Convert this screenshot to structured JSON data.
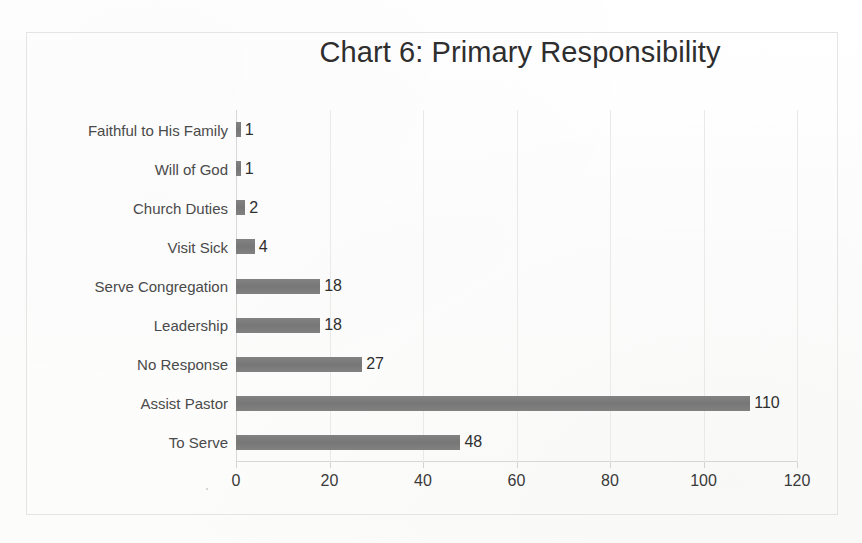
{
  "chart_data": {
    "type": "bar",
    "orientation": "horizontal",
    "title": "Chart 6: Primary Responsibility",
    "xlabel": "",
    "ylabel": "",
    "xlim": [
      0,
      120
    ],
    "xticks": [
      "0",
      "20",
      "40",
      "60",
      "80",
      "100",
      "120"
    ],
    "grid": true,
    "legend": "none",
    "bar_color": "#7c7c7c",
    "categories": [
      "Faithful to His Family",
      "Will of God",
      "Church Duties",
      "Visit Sick",
      "Serve Congregation",
      "Leadership",
      "No Response",
      "Assist Pastor",
      "To Serve"
    ],
    "values": [
      1,
      1,
      2,
      4,
      18,
      18,
      27,
      110,
      48
    ],
    "data_labels": [
      "1",
      "1",
      "2",
      "4",
      "18",
      "18",
      "27",
      "110",
      "48"
    ]
  }
}
